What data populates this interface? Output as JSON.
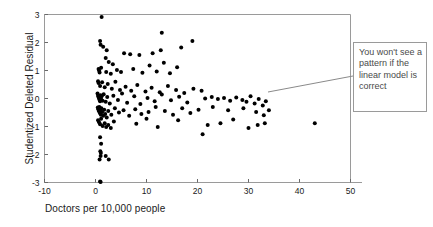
{
  "figure": {
    "background": "#ffffff",
    "frame_color": "#9a9a9a",
    "point_color": "#000000"
  },
  "annotation": {
    "text": "You won't see a pattern if the linear model is correct",
    "border_color": "#9a9a9a",
    "text_color": "#4a4a4a",
    "leader_from_x": 268,
    "leader_from_y": 92,
    "leader_to_x": 353,
    "leader_to_y": 76
  },
  "chart_data": {
    "type": "scatter",
    "title": "",
    "xlabel": "Doctors per 10,000 people",
    "ylabel": "Studentized Deleted Residual",
    "xlim": [
      -10,
      50
    ],
    "ylim": [
      -3,
      3
    ],
    "xticks": [
      -10,
      0,
      10,
      20,
      30,
      40,
      50
    ],
    "xticklabels": [
      "-10",
      "0",
      "10",
      "20",
      "30",
      "40",
      "50"
    ],
    "yticks": [
      -3,
      -2,
      -1,
      0,
      1,
      2,
      3
    ],
    "yticklabels": [
      "-3",
      "-2",
      "-1",
      "0",
      "1",
      "2",
      "3"
    ],
    "grid": false,
    "legend": null,
    "marker": "circle",
    "marker_size": 2.0,
    "points": [
      [
        1.2,
        2.91
      ],
      [
        0.9,
        2.05
      ],
      [
        1.0,
        1.92
      ],
      [
        1.5,
        1.85
      ],
      [
        2.2,
        1.72
      ],
      [
        13.0,
        2.35
      ],
      [
        19.0,
        2.05
      ],
      [
        16.8,
        1.82
      ],
      [
        5.6,
        1.62
      ],
      [
        6.8,
        1.58
      ],
      [
        8.6,
        1.55
      ],
      [
        11.2,
        1.62
      ],
      [
        12.8,
        1.72
      ],
      [
        2.0,
        1.45
      ],
      [
        2.6,
        1.3
      ],
      [
        3.4,
        1.22
      ],
      [
        0.6,
        1.05
      ],
      [
        0.7,
        1.0
      ],
      [
        0.8,
        0.93
      ],
      [
        1.1,
        1.1
      ],
      [
        2.1,
        0.95
      ],
      [
        3.0,
        0.88
      ],
      [
        4.2,
        1.02
      ],
      [
        5.0,
        0.95
      ],
      [
        7.4,
        1.05
      ],
      [
        9.2,
        0.92
      ],
      [
        10.6,
        1.18
      ],
      [
        12.0,
        0.96
      ],
      [
        13.4,
        1.28
      ],
      [
        14.6,
        0.9
      ],
      [
        16.0,
        1.12
      ],
      [
        0.5,
        0.62
      ],
      [
        0.6,
        0.55
      ],
      [
        0.9,
        0.45
      ],
      [
        1.3,
        0.58
      ],
      [
        1.8,
        0.4
      ],
      [
        2.4,
        0.52
      ],
      [
        3.2,
        0.35
      ],
      [
        3.9,
        0.6
      ],
      [
        4.8,
        0.3
      ],
      [
        5.9,
        0.42
      ],
      [
        7.0,
        0.28
      ],
      [
        8.2,
        0.48
      ],
      [
        9.8,
        0.25
      ],
      [
        11.0,
        0.38
      ],
      [
        12.6,
        0.22
      ],
      [
        14.2,
        0.45
      ],
      [
        15.8,
        0.3
      ],
      [
        17.4,
        0.2
      ],
      [
        19.2,
        0.35
      ],
      [
        20.8,
        0.28
      ],
      [
        0.4,
        0.18
      ],
      [
        0.5,
        0.1
      ],
      [
        0.6,
        0.05
      ],
      [
        0.7,
        0.0
      ],
      [
        0.8,
        -0.05
      ],
      [
        0.9,
        -0.1
      ],
      [
        1.0,
        0.12
      ],
      [
        1.1,
        -0.02
      ],
      [
        1.2,
        0.08
      ],
      [
        1.4,
        -0.08
      ],
      [
        1.6,
        0.15
      ],
      [
        2.0,
        -0.12
      ],
      [
        2.3,
        0.05
      ],
      [
        2.8,
        -0.18
      ],
      [
        3.5,
        0.1
      ],
      [
        4.4,
        -0.05
      ],
      [
        5.2,
        0.18
      ],
      [
        6.2,
        -0.15
      ],
      [
        7.6,
        0.08
      ],
      [
        8.8,
        -0.2
      ],
      [
        10.2,
        0.02
      ],
      [
        11.6,
        -0.1
      ],
      [
        13.0,
        0.14
      ],
      [
        14.8,
        -0.06
      ],
      [
        16.4,
        0.06
      ],
      [
        18.0,
        -0.14
      ],
      [
        21.5,
        0.0
      ],
      [
        22.8,
        0.05
      ],
      [
        24.0,
        -0.02
      ],
      [
        25.2,
        0.02
      ],
      [
        26.4,
        -0.08
      ],
      [
        27.6,
        0.04
      ],
      [
        28.8,
        -0.05
      ],
      [
        29.6,
        -0.12
      ],
      [
        30.4,
        0.08
      ],
      [
        31.2,
        -0.18
      ],
      [
        32.0,
        -0.02
      ],
      [
        32.8,
        -0.25
      ],
      [
        33.4,
        -0.1
      ],
      [
        0.45,
        -0.32
      ],
      [
        0.55,
        -0.38
      ],
      [
        0.65,
        -0.45
      ],
      [
        0.75,
        -0.3
      ],
      [
        0.85,
        -0.52
      ],
      [
        0.95,
        -0.42
      ],
      [
        1.05,
        -0.58
      ],
      [
        1.15,
        -0.35
      ],
      [
        1.3,
        -0.48
      ],
      [
        1.5,
        -0.62
      ],
      [
        1.7,
        -0.4
      ],
      [
        1.9,
        -0.55
      ],
      [
        2.2,
        -0.68
      ],
      [
        2.5,
        -0.45
      ],
      [
        3.1,
        -0.58
      ],
      [
        3.8,
        -0.35
      ],
      [
        4.6,
        -0.5
      ],
      [
        5.5,
        -0.42
      ],
      [
        6.6,
        -0.62
      ],
      [
        7.8,
        -0.38
      ],
      [
        9.0,
        -0.55
      ],
      [
        10.4,
        -0.48
      ],
      [
        11.8,
        -0.3
      ],
      [
        13.6,
        -0.45
      ],
      [
        15.2,
        -0.58
      ],
      [
        17.0,
        -0.35
      ],
      [
        18.6,
        -0.52
      ],
      [
        20.2,
        -0.4
      ],
      [
        23.0,
        -0.3
      ],
      [
        26.0,
        -0.42
      ],
      [
        29.0,
        -0.35
      ],
      [
        31.5,
        -0.48
      ],
      [
        33.0,
        -0.6
      ],
      [
        34.0,
        -0.42
      ],
      [
        0.5,
        -0.78
      ],
      [
        0.7,
        -0.85
      ],
      [
        0.9,
        -0.92
      ],
      [
        1.1,
        -0.72
      ],
      [
        1.4,
        -0.98
      ],
      [
        1.8,
        -0.88
      ],
      [
        2.1,
        -1.02
      ],
      [
        2.5,
        -0.95
      ],
      [
        3.0,
        -1.05
      ],
      [
        3.6,
        -0.82
      ],
      [
        8.0,
        -0.9
      ],
      [
        10.0,
        -0.72
      ],
      [
        12.2,
        -1.02
      ],
      [
        16.2,
        -0.78
      ],
      [
        22.0,
        -0.95
      ],
      [
        24.5,
        -0.88
      ],
      [
        27.0,
        -0.75
      ],
      [
        30.0,
        -1.05
      ],
      [
        31.8,
        -0.95
      ],
      [
        33.2,
        -0.88
      ],
      [
        21.0,
        -1.28
      ],
      [
        43.0,
        -0.88
      ],
      [
        0.9,
        -1.38
      ],
      [
        1.1,
        -1.62
      ],
      [
        0.95,
        -1.88
      ],
      [
        1.05,
        -1.95
      ],
      [
        1.0,
        -2.05
      ],
      [
        0.8,
        -2.18
      ],
      [
        2.0,
        -2.05
      ],
      [
        2.6,
        -2.18
      ],
      [
        0.9,
        -2.96
      ],
      [
        1.0,
        -2.98
      ]
    ]
  }
}
